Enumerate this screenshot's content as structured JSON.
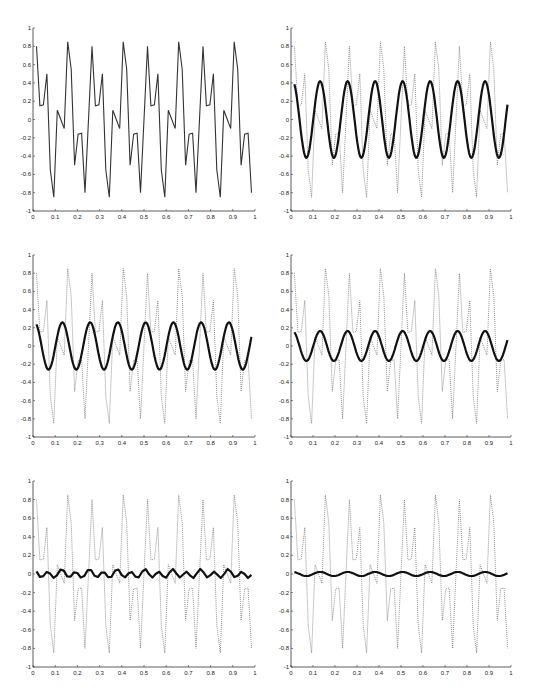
{
  "figure": {
    "layout": "3 rows x 2 columns of line plots",
    "caption_fragment": ""
  },
  "chart_data": [
    {
      "type": "line",
      "panel": "row1-col1",
      "title": "",
      "xlabel": "",
      "ylabel": "",
      "xlim": [
        0,
        1
      ],
      "ylim": [
        -1,
        1
      ],
      "xticks": [
        "0",
        "0.1",
        "0.2",
        "0.3",
        "0.4",
        "0.5",
        "0.6",
        "0.7",
        "0.8",
        "0.9",
        "1"
      ],
      "yticks": [
        "-1",
        "-0.8",
        "-0.6",
        "-0.4",
        "-0.2",
        "0",
        "0.2",
        "0.4",
        "0.6",
        "0.8",
        "1"
      ],
      "grid": false,
      "series": [
        {
          "name": "original signal",
          "style": "solid-thin",
          "sample_dx": 0.015625,
          "period_values": [
            0.8,
            0.15,
            0.16,
            0.5,
            -0.55,
            -0.85,
            0.1,
            0.0,
            -0.1,
            0.85,
            0.55,
            -0.5,
            -0.16,
            -0.15,
            -0.8,
            0.0
          ],
          "x_start": 0.015625,
          "x_end": 0.984
        }
      ]
    },
    {
      "type": "line",
      "panel": "row1-col2",
      "xlim": [
        0,
        1
      ],
      "ylim": [
        -1,
        1
      ],
      "xticks": [
        "0",
        "0.1",
        "0.2",
        "0.3",
        "0.4",
        "0.5",
        "0.6",
        "0.7",
        "0.8",
        "0.9",
        "1"
      ],
      "yticks": [
        "-1",
        "-0.8",
        "-0.6",
        "-0.4",
        "-0.2",
        "0",
        "0.2",
        "0.4",
        "0.6",
        "0.8",
        "1"
      ],
      "grid": false,
      "series": [
        {
          "name": "original signal",
          "style": "dotted"
        },
        {
          "name": "approximation",
          "style": "solid-thick",
          "amplitude": 0.42,
          "cycles": 8,
          "phase": 1.2,
          "x_start": 0.015625,
          "x_end": 0.984
        }
      ]
    },
    {
      "type": "line",
      "panel": "row2-col1",
      "xlim": [
        0,
        1
      ],
      "ylim": [
        -1,
        1
      ],
      "xticks": [
        "0",
        "0.1",
        "0.2",
        "0.3",
        "0.4",
        "0.5",
        "0.6",
        "0.7",
        "0.8",
        "0.9",
        "1"
      ],
      "yticks": [
        "-1",
        "-0.8",
        "-0.6",
        "-0.4",
        "-0.2",
        "0",
        "0.2",
        "0.4",
        "0.6",
        "0.8",
        "1"
      ],
      "grid": false,
      "series": [
        {
          "name": "original signal",
          "style": "dotted"
        },
        {
          "name": "approximation",
          "style": "solid-thick",
          "amplitude": 0.26,
          "cycles": 8,
          "phase": 1.2,
          "x_start": 0.015625,
          "x_end": 0.984
        }
      ]
    },
    {
      "type": "line",
      "panel": "row2-col2",
      "xlim": [
        0,
        1
      ],
      "ylim": [
        -1,
        1
      ],
      "xticks": [
        "0",
        "0.1",
        "0.2",
        "0.3",
        "0.4",
        "0.5",
        "0.6",
        "0.7",
        "0.8",
        "0.9",
        "1"
      ],
      "yticks": [
        "-1",
        "-0.8",
        "-0.6",
        "-0.4",
        "-0.2",
        "0",
        "0.2",
        "0.4",
        "0.6",
        "0.8",
        "1"
      ],
      "grid": false,
      "series": [
        {
          "name": "original signal",
          "style": "dotted"
        },
        {
          "name": "approximation",
          "style": "solid-thick",
          "amplitude": 0.165,
          "cycles": 8,
          "phase": 1.2,
          "x_start": 0.015625,
          "x_end": 0.984
        }
      ]
    },
    {
      "type": "line",
      "panel": "row3-col1",
      "xlim": [
        0,
        1
      ],
      "ylim": [
        -1,
        1
      ],
      "xticks": [
        "0",
        "0.1",
        "0.2",
        "0.3",
        "0.4",
        "0.5",
        "0.6",
        "0.7",
        "0.8",
        "0.9",
        "1"
      ],
      "yticks": [
        "-1",
        "-0.8",
        "-0.6",
        "-0.4",
        "-0.2",
        "0",
        "0.2",
        "0.4",
        "0.6",
        "0.8",
        "1"
      ],
      "grid": false,
      "series": [
        {
          "name": "original signal",
          "style": "dotted"
        },
        {
          "name": "approximation",
          "style": "solid-thick-zigzag",
          "amplitude": 0.05,
          "cycles": 8,
          "phase": 1.2,
          "x_start": 0.015625,
          "x_end": 0.984
        }
      ]
    },
    {
      "type": "line",
      "panel": "row3-col2",
      "xlim": [
        0,
        1
      ],
      "ylim": [
        -1,
        1
      ],
      "xticks": [
        "0",
        "0.1",
        "0.2",
        "0.3",
        "0.4",
        "0.5",
        "0.6",
        "0.7",
        "0.8",
        "0.9",
        "1"
      ],
      "yticks": [
        "-1",
        "-0.8",
        "-0.6",
        "-0.4",
        "-0.2",
        "0",
        "0.2",
        "0.4",
        "0.6",
        "0.8",
        "1"
      ],
      "grid": false,
      "series": [
        {
          "name": "original signal",
          "style": "dotted"
        },
        {
          "name": "approximation",
          "style": "solid-thick",
          "amplitude": 0.022,
          "cycles": 8,
          "phase": 1.2,
          "x_start": 0.015625,
          "x_end": 0.984
        }
      ]
    }
  ],
  "panels_geometry": [
    {
      "x0": 33,
      "x1": 255,
      "y_top": 28,
      "y_bot": 211
    },
    {
      "x0": 291,
      "x1": 511,
      "y_top": 28,
      "y_bot": 211
    },
    {
      "x0": 33,
      "x1": 255,
      "y_top": 255,
      "y_bot": 437
    },
    {
      "x0": 291,
      "x1": 511,
      "y_top": 255,
      "y_bot": 437
    },
    {
      "x0": 33,
      "x1": 255,
      "y_top": 481,
      "y_bot": 667
    },
    {
      "x0": 291,
      "x1": 511,
      "y_top": 481,
      "y_bot": 667
    }
  ]
}
